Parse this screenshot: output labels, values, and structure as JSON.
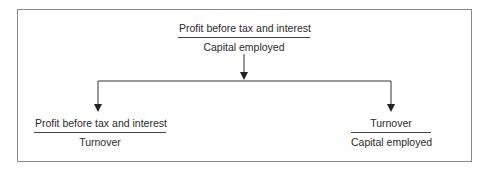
{
  "diagram": {
    "top": {
      "numerator": "Profit before tax and interest",
      "denominator": "Capital employed"
    },
    "left": {
      "numerator": "Profit before tax and interest",
      "denominator": "Turnover"
    },
    "right": {
      "numerator": "Turnover",
      "denominator": "Capital employed"
    },
    "colors": {
      "line": "#333333",
      "frame": "#8a8a8a",
      "text": "#2a2a2a"
    }
  }
}
